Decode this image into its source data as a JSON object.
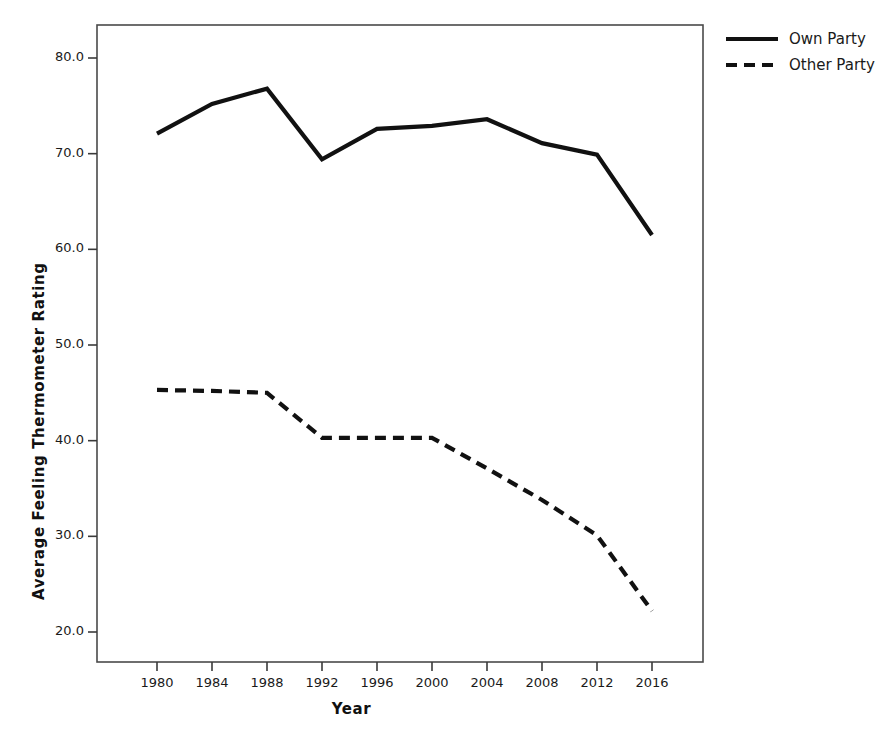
{
  "chart_data": {
    "type": "line",
    "title": "",
    "xlabel": "Year",
    "ylabel": "Average Feeling Thermometer Rating",
    "categories": [
      1980,
      1984,
      1988,
      1992,
      1996,
      2000,
      2004,
      2008,
      2012,
      2016
    ],
    "x_tick_labels": [
      "1980",
      "1984",
      "1988",
      "1992",
      "1996",
      "2000",
      "2004",
      "2008",
      "2012",
      "2016"
    ],
    "y_tick_labels": [
      "20.0",
      "30.0",
      "40.0",
      "50.0",
      "60.0",
      "70.0",
      "80.0"
    ],
    "y_ticks": [
      20.0,
      30.0,
      40.0,
      50.0,
      60.0,
      70.0,
      80.0
    ],
    "ylim": [
      16.5,
      82.5
    ],
    "xlim": [
      1977.5,
      2018.5
    ],
    "grid": false,
    "legend_position": "right-top",
    "series": [
      {
        "name": "Own Party",
        "style": "solid",
        "color": "#111111",
        "values": [
          72.1,
          75.2,
          76.8,
          69.4,
          72.6,
          72.9,
          73.6,
          71.1,
          69.9,
          61.5
        ]
      },
      {
        "name": "Other Party",
        "style": "dashed",
        "color": "#111111",
        "values": [
          45.3,
          45.2,
          45.0,
          40.3,
          40.3,
          40.3,
          37.1,
          33.8,
          30.1,
          22.2
        ]
      }
    ]
  },
  "legend": {
    "items": [
      {
        "label": "Own Party",
        "style": "solid"
      },
      {
        "label": "Other Party",
        "style": "dashed"
      }
    ]
  }
}
